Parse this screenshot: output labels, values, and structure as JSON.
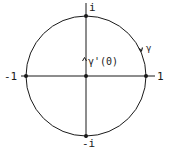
{
  "diagram": {
    "labels": {
      "top": "i",
      "bottom": "-i",
      "left": "-1",
      "right": "1",
      "curve": "γ",
      "tangent": "γ'(0)"
    },
    "points": [
      {
        "name": "i",
        "x": 0,
        "y": 1
      },
      {
        "name": "-i",
        "x": 0,
        "y": -1
      },
      {
        "name": "-1",
        "x": -1,
        "y": 0
      },
      {
        "name": "1",
        "x": 1,
        "y": 0
      },
      {
        "name": "0",
        "x": 0,
        "y": 0
      }
    ],
    "colors": {
      "stroke": "#1a1a1a",
      "background": "#ffffff"
    }
  }
}
